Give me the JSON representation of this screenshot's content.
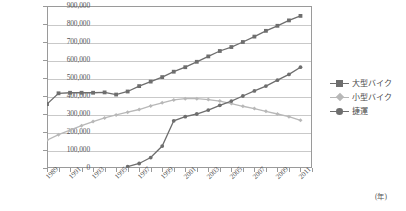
{
  "chart_data": {
    "type": "line",
    "title": "",
    "xlabel": "(年)",
    "ylabel": "",
    "xlim": [
      1989,
      2012
    ],
    "ylim": [
      0,
      900000
    ],
    "grid": true,
    "legend_position": "right",
    "x": [
      1989,
      1990,
      1991,
      1992,
      1993,
      1994,
      1995,
      1996,
      1997,
      1998,
      1999,
      2000,
      2001,
      2002,
      2003,
      2004,
      2005,
      2006,
      2007,
      2008,
      2009,
      2010,
      2011
    ],
    "x_tick_labels": [
      "1989",
      "1991",
      "1993",
      "1995",
      "1997",
      "1999",
      "2001",
      "2003",
      "2005",
      "2007",
      "2009",
      "2011"
    ],
    "y_tick_labels": [
      "0",
      "100,000",
      "200,000",
      "300,000",
      "400,000",
      "500,000",
      "600,000",
      "700,000",
      "800,000",
      "900,000"
    ],
    "y_tick_values": [
      0,
      100000,
      200000,
      300000,
      400000,
      500000,
      600000,
      700000,
      800000,
      900000
    ],
    "series": [
      {
        "name": "大型バイク",
        "color": "#6e6e6e",
        "marker": "square",
        "values": [
          355000,
          415000,
          418000,
          418000,
          418000,
          420000,
          408000,
          425000,
          455000,
          480000,
          505000,
          535000,
          560000,
          590000,
          620000,
          650000,
          672000,
          700000,
          730000,
          762000,
          790000,
          820000,
          845000
        ]
      },
      {
        "name": "小型バイク",
        "color": "#b8b8b8",
        "marker": "diamond",
        "values": [
          155000,
          185000,
          210000,
          235000,
          258000,
          278000,
          295000,
          310000,
          325000,
          345000,
          362000,
          378000,
          385000,
          385000,
          380000,
          372000,
          358000,
          343000,
          330000,
          315000,
          300000,
          285000,
          265000
        ]
      },
      {
        "name": "捷運",
        "color": "#6e6e6e",
        "marker": "circle",
        "values": [
          null,
          null,
          null,
          null,
          null,
          null,
          null,
          8000,
          25000,
          58000,
          122000,
          262000,
          285000,
          300000,
          322000,
          348000,
          372000,
          400000,
          428000,
          455000,
          488000,
          520000,
          560000
        ]
      }
    ]
  },
  "legend": {
    "items": [
      {
        "label": "大型バイク"
      },
      {
        "label": "小型バイク"
      },
      {
        "label": "捷運"
      }
    ]
  },
  "axis": {
    "x_unit": "(年)"
  }
}
